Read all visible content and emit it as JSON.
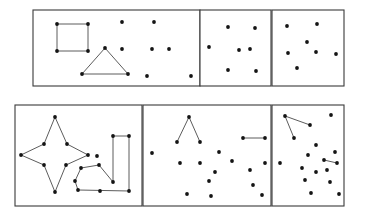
{
  "figure": {
    "background_color": "#ffffff",
    "dot_color": "#141414",
    "line_color": "#4a4a4a",
    "border_color": "#3a3a3a",
    "dot_radius": 1.9,
    "width": 378,
    "height": 224,
    "rows": 2,
    "columns": 3
  },
  "chart_data": {
    "type": "scatter",
    "xlabel": "",
    "ylabel": "",
    "grid": false,
    "legend": "none",
    "panels": [
      {
        "name": "top-left",
        "row": 1,
        "column": 1,
        "box": {
          "x": 33,
          "y": 10,
          "width": 167,
          "height": 76
        },
        "shapes": [
          "square",
          "triangle"
        ],
        "dot_count": 18,
        "points": [
          [
            57,
            24
          ],
          [
            88,
            24
          ],
          [
            57,
            51
          ],
          [
            88,
            51
          ],
          [
            105,
            48
          ],
          [
            82,
            74
          ],
          [
            128,
            74
          ],
          [
            122,
            22
          ],
          [
            154,
            22
          ],
          [
            122,
            49
          ],
          [
            152,
            49
          ],
          [
            169,
            49
          ],
          [
            147,
            76
          ],
          [
            191,
            76
          ]
        ],
        "edges": [
          [
            [
              57,
              24
            ],
            [
              88,
              24
            ]
          ],
          [
            [
              88,
              24
            ],
            [
              88,
              51
            ]
          ],
          [
            [
              88,
              51
            ],
            [
              57,
              51
            ]
          ],
          [
            [
              57,
              51
            ],
            [
              57,
              24
            ]
          ],
          [
            [
              105,
              48
            ],
            [
              82,
              74
            ]
          ],
          [
            [
              82,
              74
            ],
            [
              128,
              74
            ]
          ],
          [
            [
              128,
              74
            ],
            [
              105,
              48
            ]
          ]
        ]
      },
      {
        "name": "top-middle",
        "row": 1,
        "column": 2,
        "box": {
          "x": 200,
          "y": 10,
          "width": 71,
          "height": 76
        },
        "shapes": [],
        "dot_count": 7,
        "points": [
          [
            228,
            27
          ],
          [
            255,
            28
          ],
          [
            209,
            47
          ],
          [
            239,
            50
          ],
          [
            250,
            49
          ],
          [
            228,
            70
          ],
          [
            256,
            71
          ]
        ],
        "edges": []
      },
      {
        "name": "top-right",
        "row": 1,
        "column": 3,
        "box": {
          "x": 272,
          "y": 10,
          "width": 72,
          "height": 76
        },
        "shapes": [],
        "dot_count": 7,
        "points": [
          [
            287,
            26
          ],
          [
            317,
            24
          ],
          [
            307,
            42
          ],
          [
            288,
            53
          ],
          [
            316,
            52
          ],
          [
            336,
            54
          ],
          [
            297,
            68
          ]
        ],
        "edges": []
      },
      {
        "name": "bottom-left",
        "row": 2,
        "column": 1,
        "box": {
          "x": 15,
          "y": 105,
          "width": 127,
          "height": 101
        },
        "shapes": [
          "four-pointed-star",
          "arc",
          "hook"
        ],
        "dot_count": 18,
        "points": [
          [
            55,
            117
          ],
          [
            44,
            144
          ],
          [
            67,
            144
          ],
          [
            21,
            155
          ],
          [
            88,
            155
          ],
          [
            44,
            165
          ],
          [
            66,
            165
          ],
          [
            55,
            192
          ],
          [
            97,
            156
          ],
          [
            81,
            168
          ],
          [
            99,
            165
          ],
          [
            75,
            181
          ],
          [
            78,
            190
          ],
          [
            100,
            191
          ],
          [
            113,
            136
          ],
          [
            129,
            136
          ],
          [
            113,
            182
          ],
          [
            129,
            191
          ]
        ],
        "edges": [
          [
            [
              55,
              117
            ],
            [
              44,
              144
            ]
          ],
          [
            [
              44,
              144
            ],
            [
              21,
              155
            ]
          ],
          [
            [
              21,
              155
            ],
            [
              44,
              165
            ]
          ],
          [
            [
              44,
              165
            ],
            [
              55,
              192
            ]
          ],
          [
            [
              55,
              192
            ],
            [
              66,
              165
            ]
          ],
          [
            [
              66,
              165
            ],
            [
              88,
              155
            ]
          ],
          [
            [
              88,
              155
            ],
            [
              67,
              144
            ]
          ],
          [
            [
              67,
              144
            ],
            [
              55,
              117
            ]
          ],
          [
            [
              113,
              182
            ],
            [
              99,
              165
            ]
          ],
          [
            [
              99,
              165
            ],
            [
              81,
              168
            ]
          ],
          [
            [
              81,
              168
            ],
            [
              75,
              181
            ]
          ],
          [
            [
              75,
              181
            ],
            [
              78,
              190
            ]
          ],
          [
            [
              78,
              190
            ],
            [
              129,
              191
            ]
          ],
          [
            [
              129,
              191
            ],
            [
              129,
              136
            ]
          ],
          [
            [
              129,
              136
            ],
            [
              113,
              136
            ]
          ],
          [
            [
              113,
              136
            ],
            [
              113,
              182
            ]
          ]
        ]
      },
      {
        "name": "bottom-middle",
        "row": 2,
        "column": 2,
        "box": {
          "x": 143,
          "y": 105,
          "width": 128,
          "height": 101
        },
        "shapes": [
          "lambda-peak",
          "segment"
        ],
        "dot_count": 16,
        "points": [
          [
            189,
            117
          ],
          [
            177,
            142
          ],
          [
            200,
            142
          ],
          [
            243,
            138
          ],
          [
            265,
            138
          ],
          [
            152,
            153
          ],
          [
            219,
            152
          ],
          [
            180,
            163
          ],
          [
            200,
            163
          ],
          [
            232,
            161
          ],
          [
            265,
            163
          ],
          [
            215,
            172
          ],
          [
            250,
            170
          ],
          [
            209,
            181
          ],
          [
            253,
            185
          ],
          [
            187,
            194
          ],
          [
            211,
            196
          ],
          [
            262,
            195
          ]
        ],
        "edges": [
          [
            [
              189,
              117
            ],
            [
              177,
              142
            ]
          ],
          [
            [
              189,
              117
            ],
            [
              200,
              142
            ]
          ],
          [
            [
              243,
              138
            ],
            [
              265,
              138
            ]
          ]
        ]
      },
      {
        "name": "bottom-right",
        "row": 2,
        "column": 3,
        "box": {
          "x": 272,
          "y": 105,
          "width": 72,
          "height": 101
        },
        "shapes": [
          "fan",
          "segment"
        ],
        "dot_count": 17,
        "points": [
          [
            285,
            116
          ],
          [
            310,
            125
          ],
          [
            331,
            115
          ],
          [
            294,
            138
          ],
          [
            316,
            145
          ],
          [
            308,
            155
          ],
          [
            335,
            152
          ],
          [
            280,
            163
          ],
          [
            324,
            160
          ],
          [
            337,
            163
          ],
          [
            302,
            168
          ],
          [
            316,
            172
          ],
          [
            327,
            170
          ],
          [
            305,
            180
          ],
          [
            330,
            182
          ],
          [
            311,
            193
          ],
          [
            339,
            194
          ]
        ],
        "edges": [
          [
            [
              285,
              116
            ],
            [
              310,
              125
            ]
          ],
          [
            [
              285,
              116
            ],
            [
              294,
              138
            ]
          ],
          [
            [
              324,
              160
            ],
            [
              337,
              163
            ]
          ]
        ]
      }
    ]
  }
}
